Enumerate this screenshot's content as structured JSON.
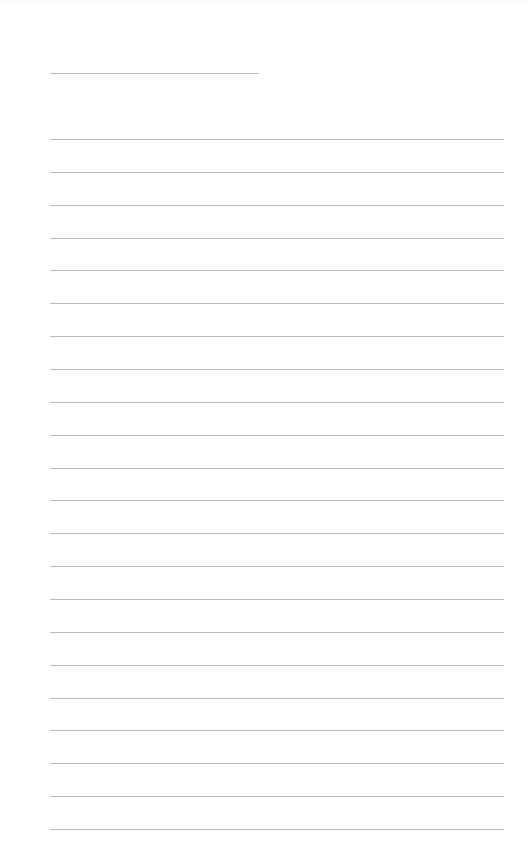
{
  "page": {
    "type": "lined-notebook-page",
    "background_color": "#ffffff",
    "line_color": "#bcbcbc",
    "title_line": {
      "left": 50,
      "top": 73,
      "width": 209
    },
    "ruled_lines": {
      "count": 22,
      "left": 50,
      "width": 454,
      "first_top": 139,
      "spacing": 32.86
    }
  }
}
